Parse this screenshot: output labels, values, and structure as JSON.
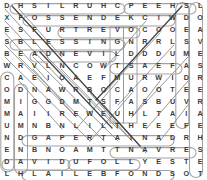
{
  "puzzle": {
    "type": "word-search",
    "rows": 15,
    "cols": 15,
    "letter_color": "#3b3b3b",
    "mark_color": "#9a9a9a",
    "dark_mark_color": "#3a3a3a",
    "background": "#ffffff",
    "grid": [
      [
        "D",
        "H",
        "S",
        "I",
        "L",
        "R",
        "U",
        "H",
        "C",
        "P",
        "E",
        "E",
        "H",
        "S",
        "L"
      ],
      [
        "X",
        "F",
        "O",
        "S",
        "S",
        "E",
        "N",
        "D",
        "E",
        "K",
        "C",
        "I",
        "W",
        "D",
        "O"
      ],
      [
        "E",
        "S",
        "F",
        "U",
        "R",
        "T",
        "R",
        "E",
        "V",
        "O",
        "C",
        "O",
        "O",
        "E",
        "A"
      ],
      [
        "S",
        "B",
        "L",
        "E",
        "S",
        "S",
        "I",
        "N",
        "G",
        "N",
        "R",
        "R",
        "L",
        "S",
        "V"
      ],
      [
        "B",
        "E",
        "A",
        "D",
        "N",
        "E",
        "V",
        "I",
        "L",
        "D",
        "D",
        "D",
        "U",
        "M",
        "E"
      ],
      [
        "W",
        "R",
        "V",
        "L",
        "N",
        "C",
        "O",
        "W",
        "T",
        "S",
        "A",
        "E",
        "F",
        "A",
        "S"
      ],
      [
        "C",
        "A",
        "E",
        "I",
        "O",
        "A",
        "E",
        "F",
        "M",
        "U",
        "R",
        "W",
        "I",
        "D",
        "R"
      ],
      [
        "O",
        "D",
        "N",
        "A",
        "W",
        "R",
        "B",
        "O",
        "C",
        "A",
        "O",
        "O",
        "T",
        "E",
        "E"
      ],
      [
        "M",
        "I",
        "G",
        "G",
        "D",
        "M",
        "T",
        "S",
        "F",
        "A",
        "S",
        "B",
        "U",
        "V",
        "R"
      ],
      [
        "M",
        "A",
        "I",
        "I",
        "R",
        "E",
        "W",
        "E",
        "U",
        "H",
        "L",
        "T",
        "A",
        "I",
        "A"
      ],
      [
        "U",
        "M",
        "N",
        "B",
        "N",
        "L",
        "I",
        "L",
        "T",
        "H",
        "E",
        "E",
        "E",
        "F",
        "E"
      ],
      [
        "N",
        "D",
        "G",
        "A",
        "P",
        "E",
        "R",
        "T",
        "A",
        "I",
        "N",
        "A",
        "D",
        "R",
        "H"
      ],
      [
        "E",
        "N",
        "B",
        "N",
        "O",
        "A",
        "M",
        "T",
        "T",
        "N",
        "A",
        "V",
        "R",
        "E",
        "S"
      ],
      [
        "D",
        "A",
        "V",
        "I",
        "D",
        "U",
        "F",
        "O",
        "L",
        "L",
        "Y",
        "E",
        "S",
        "T",
        "E"
      ],
      [
        "L",
        "H",
        "L",
        "A",
        "I",
        "L",
        "E",
        "B",
        "F",
        "O",
        "N",
        "D",
        "S",
        "O",
        "T"
      ]
    ],
    "found_words": [
      "SHEEP",
      "CHURLISH",
      "LOAVES",
      "WICKEDNESS",
      "COVERT",
      "BLESSING",
      "DIVINE",
      "FEAST",
      "SERVANT",
      "APPERTAIN",
      "DAVID",
      "FOLLY",
      "BELIAL",
      "FONDS",
      "SHEARER",
      "COMMUNED",
      "ABIGAIL",
      "CARMEL"
    ]
  }
}
